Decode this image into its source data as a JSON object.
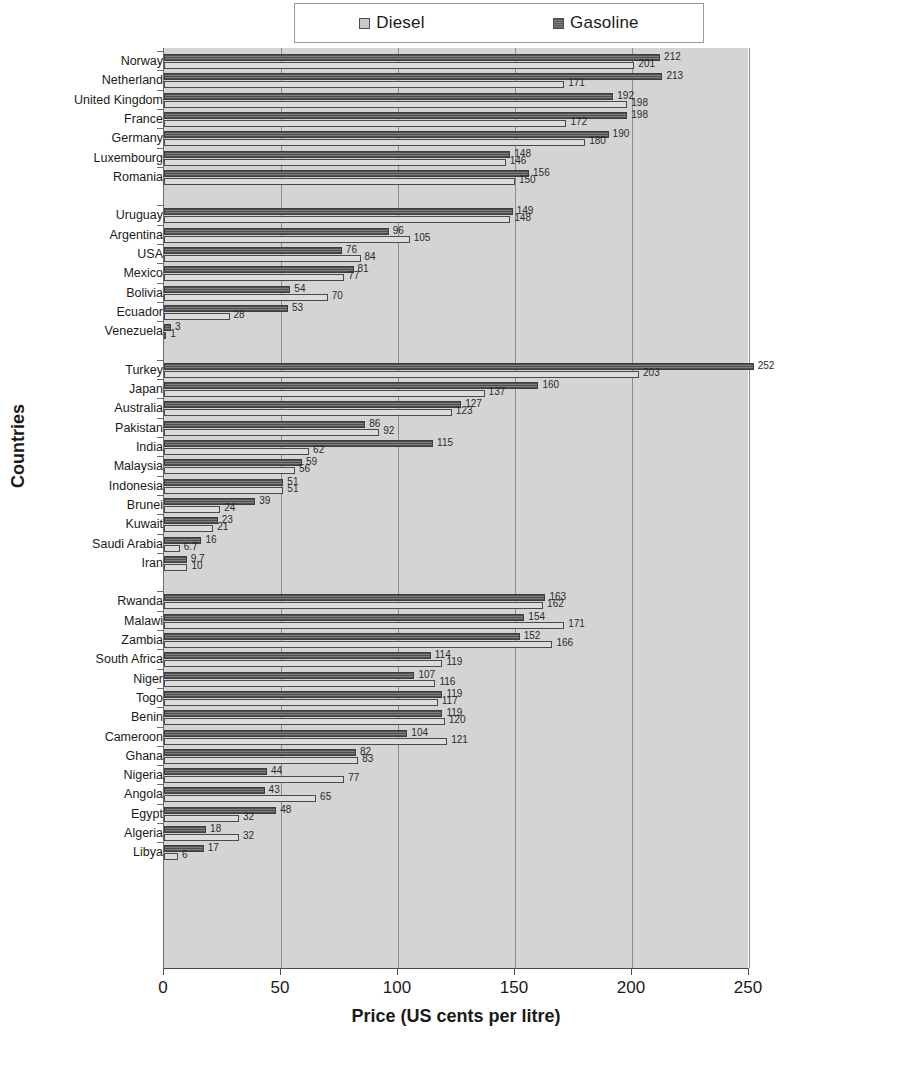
{
  "chart_data": {
    "type": "bar",
    "orientation": "horizontal",
    "title": "",
    "xlabel": "Price (US cents per litre)",
    "ylabel": "Countries",
    "xlim": [
      0,
      250
    ],
    "xticks": [
      0,
      50,
      100,
      150,
      200,
      250
    ],
    "grid": true,
    "legend_position": "top",
    "series": [
      {
        "name": "Diesel",
        "color": "#dcdcdc"
      },
      {
        "name": "Gasoline",
        "color": "#6b6b6b"
      }
    ],
    "groups": [
      {
        "name": "Europe",
        "rows": [
          {
            "country": "Norway",
            "gasoline": 212,
            "diesel": 201
          },
          {
            "country": "Netherland",
            "gasoline": 213,
            "diesel": 171
          },
          {
            "country": "United Kingdom",
            "gasoline": 192,
            "diesel": 198
          },
          {
            "country": "France",
            "gasoline": 198,
            "diesel": 172
          },
          {
            "country": "Germany",
            "gasoline": 190,
            "diesel": 180
          },
          {
            "country": "Luxembourg",
            "gasoline": 148,
            "diesel": 146
          },
          {
            "country": "Romania",
            "gasoline": 156,
            "diesel": 150
          }
        ]
      },
      {
        "name": "Americas",
        "rows": [
          {
            "country": "Uruguay",
            "gasoline": 149,
            "diesel": 148
          },
          {
            "country": "Argentina",
            "gasoline": 96,
            "diesel": 105
          },
          {
            "country": "USA",
            "gasoline": 76,
            "diesel": 84
          },
          {
            "country": "Mexico",
            "gasoline": 81,
            "diesel": 77
          },
          {
            "country": "Bolivia",
            "gasoline": 54,
            "diesel": 70
          },
          {
            "country": "Ecuador",
            "gasoline": 53,
            "diesel": 28
          },
          {
            "country": "Venezuela",
            "gasoline": 3,
            "diesel": 1
          }
        ]
      },
      {
        "name": "Asia-Pacific",
        "rows": [
          {
            "country": "Turkey",
            "gasoline": 252,
            "diesel": 203
          },
          {
            "country": "Japan",
            "gasoline": 160,
            "diesel": 137
          },
          {
            "country": "Australia",
            "gasoline": 127,
            "diesel": 123
          },
          {
            "country": "Pakistan",
            "gasoline": 86,
            "diesel": 92
          },
          {
            "country": "India",
            "gasoline": 115,
            "diesel": 62
          },
          {
            "country": "Malaysia",
            "gasoline": 59,
            "diesel": 56
          },
          {
            "country": "Indonesia",
            "gasoline": 51,
            "diesel": 51
          },
          {
            "country": "Brunei",
            "gasoline": 39,
            "diesel": 24
          },
          {
            "country": "Kuwait",
            "gasoline": 23,
            "diesel": 21
          },
          {
            "country": "Saudi Arabia",
            "gasoline": 16,
            "diesel": 6.7
          },
          {
            "country": "Iran",
            "gasoline": 9.7,
            "diesel": 10
          }
        ]
      },
      {
        "name": "Africa",
        "rows": [
          {
            "country": "Rwanda",
            "gasoline": 163,
            "diesel": 162
          },
          {
            "country": "Malawi",
            "gasoline": 154,
            "diesel": 171
          },
          {
            "country": "Zambia",
            "gasoline": 152,
            "diesel": 166
          },
          {
            "country": "South Africa",
            "gasoline": 114,
            "diesel": 119
          },
          {
            "country": "Niger",
            "gasoline": 107,
            "diesel": 116
          },
          {
            "country": "Togo",
            "gasoline": 119,
            "diesel": 117
          },
          {
            "country": "Benin",
            "gasoline": 119,
            "diesel": 120
          },
          {
            "country": "Cameroon",
            "gasoline": 104,
            "diesel": 121
          },
          {
            "country": "Ghana",
            "gasoline": 82,
            "diesel": 83
          },
          {
            "country": "Nigeria",
            "gasoline": 44,
            "diesel": 77
          },
          {
            "country": "Angola",
            "gasoline": 43,
            "diesel": 65
          },
          {
            "country": "Egypt",
            "gasoline": 48,
            "diesel": 32
          },
          {
            "country": "Algeria",
            "gasoline": 18,
            "diesel": 32
          },
          {
            "country": "Libya",
            "gasoline": 17,
            "diesel": 6
          }
        ]
      }
    ]
  },
  "legend": {
    "diesel_label": "Diesel",
    "gasoline_label": "Gasoline"
  },
  "axes": {
    "x_title": "Price (US cents per litre)",
    "y_title": "Countries"
  }
}
